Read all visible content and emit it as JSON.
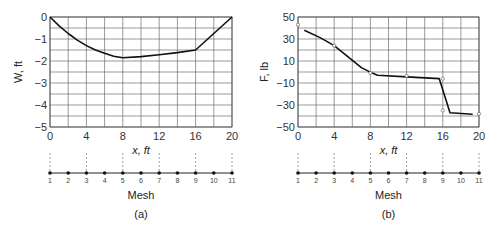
{
  "chart_data": [
    {
      "type": "line",
      "panel_label": "(a)",
      "title": "",
      "xlabel": "x, ft",
      "ylabel": "W, ft",
      "xlim": [
        0,
        20
      ],
      "ylim": [
        -5,
        0
      ],
      "xticks": [
        0,
        4,
        8,
        12,
        16,
        20
      ],
      "yticks": [
        0,
        -1,
        -2,
        -3,
        -4,
        -5
      ],
      "xtick_labels": [
        "0",
        "4",
        "8",
        "12",
        "16",
        "20"
      ],
      "ytick_labels": [
        "0",
        "−1",
        "−2",
        "−3",
        "−4",
        "−5"
      ],
      "grid": true,
      "grid_x_step": 2,
      "grid_y_step": 0.5,
      "series": [
        {
          "name": "W",
          "x": [
            0,
            1,
            2,
            3,
            4,
            5,
            6,
            7,
            8,
            10,
            12,
            14,
            16,
            18,
            20
          ],
          "y": [
            0,
            -0.4,
            -0.75,
            -1.05,
            -1.3,
            -1.5,
            -1.65,
            -1.78,
            -1.85,
            -1.8,
            -1.72,
            -1.62,
            -1.5,
            -0.75,
            0
          ]
        }
      ],
      "mesh": {
        "label": "Mesh",
        "nodes": [
          "1",
          "2",
          "3",
          "4",
          "5",
          "6",
          "7",
          "8",
          "9",
          "10",
          "11"
        ],
        "dashed_nodes": [
          1,
          3,
          5,
          7,
          9,
          11
        ]
      }
    },
    {
      "type": "line",
      "panel_label": "(b)",
      "title": "",
      "xlabel": "x, ft",
      "ylabel": "F, lb",
      "xlim": [
        0,
        20
      ],
      "ylim": [
        -50,
        50
      ],
      "xticks": [
        0,
        4,
        8,
        12,
        16,
        20
      ],
      "yticks": [
        50,
        30,
        10,
        -10,
        -30,
        -50
      ],
      "xtick_labels": [
        "0",
        "4",
        "8",
        "12",
        "16",
        "20"
      ],
      "ytick_labels": [
        "50",
        "30",
        "10",
        "−10",
        "−30",
        "−50"
      ],
      "grid": true,
      "grid_x_step": 2,
      "grid_y_step": 10,
      "series": [
        {
          "name": "F",
          "x": [
            0.7,
            2.5,
            4,
            5.5,
            7,
            8.2,
            8.8,
            12,
            15.6,
            16.8,
            19.3
          ],
          "y": [
            38,
            31,
            24,
            14,
            4,
            -1,
            -3,
            -4.5,
            -6,
            -37,
            -38.5
          ]
        },
        {
          "name": "markers",
          "style": "open-circle",
          "x": [
            0,
            4,
            8,
            12,
            16,
            16,
            20
          ],
          "y": [
            43,
            24,
            -1,
            -3.5,
            -6,
            -35,
            -38
          ]
        }
      ],
      "mesh": {
        "label": "Mesh",
        "nodes": [
          "1",
          "2",
          "3",
          "4",
          "5",
          "6",
          "7",
          "8",
          "9",
          "10",
          "11"
        ],
        "dashed_nodes": [
          1,
          3,
          5,
          7,
          9,
          11
        ]
      }
    }
  ]
}
